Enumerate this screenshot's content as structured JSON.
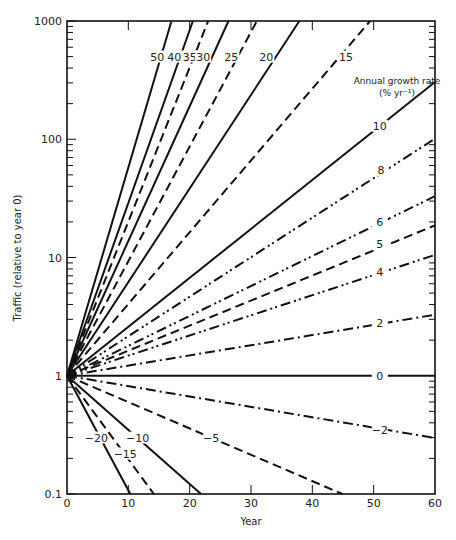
{
  "chart_data": {
    "type": "line",
    "title": "",
    "xlabel": "Year",
    "ylabel": "Traffic (relative to year 0)",
    "xlim": [
      0,
      60
    ],
    "ylim": [
      0.1,
      1000
    ],
    "yscale": "log",
    "grid": false,
    "x_ticks": [
      0,
      10,
      20,
      30,
      40,
      50,
      60
    ],
    "y_ticks": [
      "0.1",
      "1",
      "10",
      "100",
      "1000"
    ],
    "legend_title": "Annual growth rate",
    "legend_subtitle": "(% yr⁻¹)",
    "formula": "traffic = (1 + r/100)^year",
    "series": [
      {
        "name": "50",
        "rate": 50,
        "style": "solid",
        "label_pos": [
          14.7,
          500
        ]
      },
      {
        "name": "40",
        "rate": 40,
        "style": "solid",
        "label_pos": [
          17.5,
          500
        ]
      },
      {
        "name": "35",
        "rate": 35,
        "style": "dashed",
        "label_pos": [
          20,
          500
        ]
      },
      {
        "name": "30",
        "rate": 30,
        "style": "solid",
        "label_pos": [
          22.2,
          500
        ]
      },
      {
        "name": "25",
        "rate": 25,
        "style": "dashed",
        "label_pos": [
          26.8,
          500
        ]
      },
      {
        "name": "20",
        "rate": 20,
        "style": "solid",
        "label_pos": [
          32.5,
          500
        ]
      },
      {
        "name": "15",
        "rate": 15,
        "style": "dashed",
        "label_pos": [
          45.5,
          500
        ]
      },
      {
        "name": "10",
        "rate": 10,
        "style": "solid",
        "label_pos": [
          51,
          130
        ]
      },
      {
        "name": "8",
        "rate": 8,
        "style": "dash-dot-dot",
        "label_pos": [
          51.2,
          55
        ]
      },
      {
        "name": "6",
        "rate": 6,
        "style": "dash-dot-dot",
        "label_pos": [
          51,
          20
        ]
      },
      {
        "name": "5",
        "rate": 5,
        "style": "dashed",
        "label_pos": [
          51,
          13
        ]
      },
      {
        "name": "4",
        "rate": 4,
        "style": "dash-dot-dot",
        "label_pos": [
          51,
          7.5
        ]
      },
      {
        "name": "2",
        "rate": 2,
        "style": "dash-dot",
        "label_pos": [
          51,
          2.8
        ]
      },
      {
        "name": "0",
        "rate": 0,
        "style": "solid",
        "label_pos": [
          51,
          1
        ]
      },
      {
        "name": "−2",
        "rate": -2,
        "style": "dash-dot",
        "label_pos": [
          51,
          0.35
        ]
      },
      {
        "name": "−5",
        "rate": -5,
        "style": "dashed",
        "label_pos": [
          23.5,
          0.3
        ]
      },
      {
        "name": "−10",
        "rate": -10,
        "style": "solid",
        "label_pos": [
          11.5,
          0.3
        ]
      },
      {
        "name": "−15",
        "rate": -15,
        "style": "dashed",
        "label_pos": [
          9.5,
          0.22
        ]
      },
      {
        "name": "−20",
        "rate": -20,
        "style": "solid",
        "label_pos": [
          4.8,
          0.3
        ]
      }
    ]
  }
}
